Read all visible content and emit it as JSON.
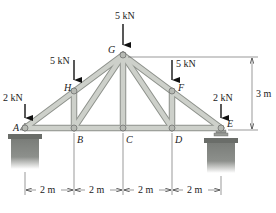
{
  "diagram": {
    "type": "roof truss",
    "nodes": {
      "A": {
        "label": "A",
        "x": 25,
        "y": 128
      },
      "B": {
        "label": "B",
        "x": 74,
        "y": 128
      },
      "C": {
        "label": "C",
        "x": 123,
        "y": 128
      },
      "D": {
        "label": "D",
        "x": 172,
        "y": 128
      },
      "E": {
        "label": "E",
        "x": 221,
        "y": 128
      },
      "H": {
        "label": "H",
        "x": 74,
        "y": 91
      },
      "G": {
        "label": "G",
        "x": 123,
        "y": 55
      },
      "F": {
        "label": "F",
        "x": 172,
        "y": 91
      }
    },
    "members": [
      "AB",
      "BC",
      "CD",
      "DE",
      "AH",
      "HG",
      "GF",
      "FE",
      "HB",
      "GC",
      "FD",
      "HC",
      "GB",
      "GD",
      "FC"
    ],
    "loads": [
      {
        "node": "A",
        "label": "2 kN"
      },
      {
        "node": "H",
        "label": "5 kN"
      },
      {
        "node": "G",
        "label": "5 kN"
      },
      {
        "node": "F",
        "label": "5 kN"
      },
      {
        "node": "E",
        "label": "2 kN"
      }
    ],
    "dimensions": {
      "spans": [
        "2 m",
        "2 m",
        "2 m",
        "2 m"
      ],
      "height": "3 m"
    },
    "supports": {
      "A": "pin",
      "E": "roller"
    },
    "colors": {
      "member_fill": "#c9ccc6",
      "member_stroke": "#8e928c",
      "support": "#6f726e",
      "line": "#333333"
    }
  }
}
